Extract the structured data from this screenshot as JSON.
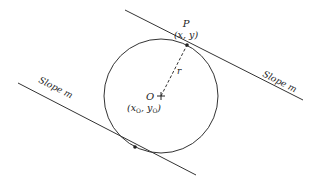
{
  "diagram": {
    "colors": {
      "stroke": "#333333",
      "background": "#ffffff"
    },
    "point_p": {
      "name": "P",
      "coords": "(x, y)"
    },
    "center": {
      "name": "O",
      "coords_x": "x",
      "coords_y": "y",
      "subscript": "O"
    },
    "radius_label": "r",
    "upper_line_label": "Slope m",
    "lower_line_label": "Slope m",
    "slope_word": "Slope",
    "slope_symbol": "m"
  }
}
